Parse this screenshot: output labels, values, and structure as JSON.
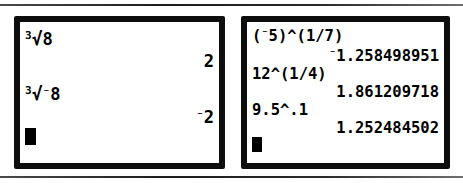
{
  "figure": {
    "type": "calculator-screenshots",
    "screen_count": 2
  },
  "rules": {
    "top": "horizontal-rule",
    "bottom": "horizontal-rule"
  },
  "left_screen": {
    "name": "calculator-screen-left",
    "lines": [
      {
        "kind": "entry",
        "radix": "3",
        "radical": "√",
        "operand": "8",
        "negative": false,
        "text": "³√8"
      },
      {
        "kind": "result",
        "value": "2",
        "negative": false
      },
      {
        "kind": "entry",
        "radix": "3",
        "radical": "√",
        "operand": "8",
        "negative": true,
        "text": "³√⁻8"
      },
      {
        "kind": "result",
        "value": "2",
        "negative": true
      },
      {
        "kind": "cursor",
        "text": ""
      }
    ],
    "entry_1_radix": "3",
    "entry_1_operand": "8",
    "result_1": "2",
    "entry_2_radix": "3",
    "entry_2_operand": "8",
    "result_2": "2",
    "neg_sign": "⁻",
    "radical_sign": "√"
  },
  "right_screen": {
    "name": "calculator-screen-right",
    "lines": [
      {
        "kind": "entry",
        "text": "(⁻5)^(1/7)"
      },
      {
        "kind": "result",
        "text": "⁻1.258498951"
      },
      {
        "kind": "entry",
        "text": "12^(1/4)"
      },
      {
        "kind": "result",
        "text": "1.861209718"
      },
      {
        "kind": "entry",
        "text": "9.5^.1"
      },
      {
        "kind": "result",
        "text": "1.252484502"
      },
      {
        "kind": "cursor",
        "text": ""
      }
    ],
    "entry_1_prefix": "(",
    "entry_1_base": "5",
    "entry_1_suffix": ")^(1/7)",
    "result_1": "1.258498951",
    "entry_2": "12^(1/4)",
    "result_2": "1.861209718",
    "entry_3": "9.5^.1",
    "result_3": "1.252484502",
    "neg_sign": "⁻"
  },
  "colors": {
    "bezel": "#0d0d0d",
    "screen_background": "#ffffff",
    "text": "#000000",
    "rule": "#1c1c1c"
  }
}
